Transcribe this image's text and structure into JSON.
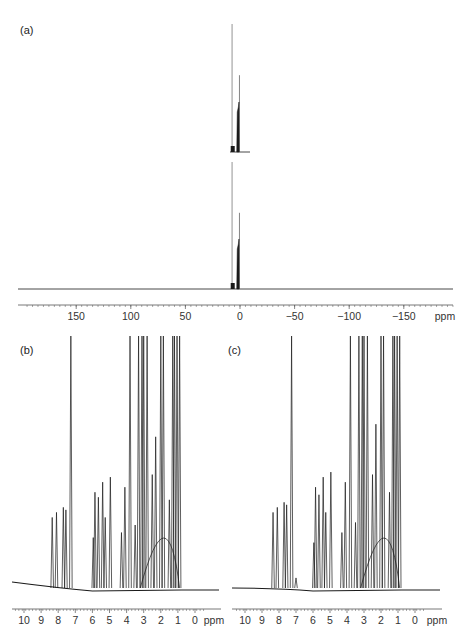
{
  "chart_data": [
    {
      "panel": "(a)",
      "type": "line",
      "title": "",
      "xlabel": "ppm",
      "ylabel": "",
      "x_reversed": true,
      "xlim": [
        200,
        -200
      ],
      "ticks": [
        150,
        100,
        50,
        0,
        -50,
        -100,
        -150
      ],
      "tick_labels": [
        "150",
        "100",
        "50",
        "0",
        "−50",
        "−100",
        "−150"
      ],
      "grid": false,
      "series": [
        {
          "name": "upper trace",
          "peaks": [
            {
              "ppm": 7.26,
              "rel_height": 1.0
            },
            {
              "ppm": 3.5,
              "rel_height": 0.35
            },
            {
              "ppm": 2.0,
              "rel_height": 0.4
            },
            {
              "ppm": 1.0,
              "rel_height": 0.6
            }
          ]
        },
        {
          "name": "lower trace",
          "peaks": [
            {
              "ppm": 7.26,
              "rel_height": 1.0
            },
            {
              "ppm": 3.5,
              "rel_height": 0.3
            },
            {
              "ppm": 2.0,
              "rel_height": 0.35
            },
            {
              "ppm": 1.0,
              "rel_height": 0.55
            }
          ]
        }
      ]
    },
    {
      "panel": "(b)",
      "type": "line",
      "xlabel": "ppm",
      "x_reversed": true,
      "xlim": [
        10.5,
        -0.5
      ],
      "ticks": [
        10,
        9,
        8,
        7,
        6,
        5,
        4,
        3,
        2,
        1,
        0
      ],
      "tick_labels": [
        "10",
        "9",
        "8",
        "7",
        "6",
        "5",
        "4",
        "3",
        "2",
        "1",
        "0"
      ],
      "grid": false,
      "peaks": [
        {
          "ppm": 8.35,
          "rel_height": 0.28
        },
        {
          "ppm": 8.1,
          "rel_height": 0.3
        },
        {
          "ppm": 7.7,
          "rel_height": 0.32
        },
        {
          "ppm": 7.55,
          "rel_height": 0.31
        },
        {
          "ppm": 7.26,
          "rel_height": 1.0
        },
        {
          "ppm": 5.95,
          "rel_height": 0.2
        },
        {
          "ppm": 5.85,
          "rel_height": 0.38
        },
        {
          "ppm": 5.65,
          "rel_height": 0.36
        },
        {
          "ppm": 5.4,
          "rel_height": 0.42
        },
        {
          "ppm": 5.25,
          "rel_height": 0.28
        },
        {
          "ppm": 4.95,
          "rel_height": 0.44
        },
        {
          "ppm": 4.3,
          "rel_height": 0.22
        },
        {
          "ppm": 4.1,
          "rel_height": 0.4
        },
        {
          "ppm": 3.8,
          "rel_height": 1.0
        },
        {
          "ppm": 3.5,
          "rel_height": 0.25
        },
        {
          "ppm": 3.3,
          "rel_height": 1.0
        },
        {
          "ppm": 3.1,
          "rel_height": 1.0
        },
        {
          "ppm": 3.0,
          "rel_height": 1.0
        },
        {
          "ppm": 2.8,
          "rel_height": 1.0
        },
        {
          "ppm": 2.5,
          "rel_height": 0.45
        },
        {
          "ppm": 2.3,
          "rel_height": 0.6
        },
        {
          "ppm": 2.0,
          "rel_height": 1.0
        },
        {
          "ppm": 1.85,
          "rel_height": 1.0
        },
        {
          "ppm": 1.5,
          "rel_height": 0.35
        },
        {
          "ppm": 1.3,
          "rel_height": 1.0
        },
        {
          "ppm": 1.2,
          "rel_height": 1.0
        },
        {
          "ppm": 1.05,
          "rel_height": 1.0
        },
        {
          "ppm": 0.9,
          "rel_height": 1.0
        }
      ]
    },
    {
      "panel": "(c)",
      "type": "line",
      "xlabel": "ppm",
      "x_reversed": true,
      "xlim": [
        10.5,
        -0.5
      ],
      "ticks": [
        10,
        9,
        8,
        7,
        6,
        5,
        4,
        3,
        2,
        1,
        0
      ],
      "tick_labels": [
        "10",
        "9",
        "8",
        "7",
        "6",
        "5",
        "4",
        "3",
        "2",
        "1",
        "0"
      ],
      "grid": false,
      "peaks": [
        {
          "ppm": 8.35,
          "rel_height": 0.3
        },
        {
          "ppm": 8.1,
          "rel_height": 0.32
        },
        {
          "ppm": 7.7,
          "rel_height": 0.34
        },
        {
          "ppm": 7.55,
          "rel_height": 0.33
        },
        {
          "ppm": 7.26,
          "rel_height": 1.0
        },
        {
          "ppm": 7.0,
          "rel_height": 0.04
        },
        {
          "ppm": 5.95,
          "rel_height": 0.18
        },
        {
          "ppm": 5.85,
          "rel_height": 0.4
        },
        {
          "ppm": 5.65,
          "rel_height": 0.37
        },
        {
          "ppm": 5.4,
          "rel_height": 0.44
        },
        {
          "ppm": 5.25,
          "rel_height": 0.3
        },
        {
          "ppm": 4.95,
          "rel_height": 0.46
        },
        {
          "ppm": 4.3,
          "rel_height": 0.22
        },
        {
          "ppm": 4.1,
          "rel_height": 0.42
        },
        {
          "ppm": 3.8,
          "rel_height": 1.0
        },
        {
          "ppm": 3.5,
          "rel_height": 0.26
        },
        {
          "ppm": 3.3,
          "rel_height": 1.0
        },
        {
          "ppm": 3.1,
          "rel_height": 1.0
        },
        {
          "ppm": 3.0,
          "rel_height": 1.0
        },
        {
          "ppm": 2.8,
          "rel_height": 1.0
        },
        {
          "ppm": 2.5,
          "rel_height": 0.45
        },
        {
          "ppm": 2.3,
          "rel_height": 0.65
        },
        {
          "ppm": 2.0,
          "rel_height": 1.0
        },
        {
          "ppm": 1.85,
          "rel_height": 1.0
        },
        {
          "ppm": 1.5,
          "rel_height": 0.38
        },
        {
          "ppm": 1.3,
          "rel_height": 1.0
        },
        {
          "ppm": 1.2,
          "rel_height": 1.0
        },
        {
          "ppm": 1.05,
          "rel_height": 1.0
        },
        {
          "ppm": 0.9,
          "rel_height": 1.0
        }
      ]
    }
  ],
  "labels": {
    "a": "(a)",
    "b": "(b)",
    "c": "(c)",
    "ppm": "ppm"
  },
  "colors": {
    "trace": "#1a1a1a",
    "axis": "#555555",
    "text": "#333333"
  }
}
